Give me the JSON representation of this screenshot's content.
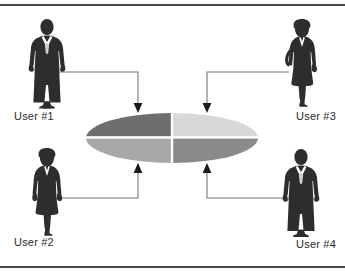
{
  "diagram": {
    "type": "node-hub-diagram",
    "frame": {
      "rule_color": "#4a4a4a",
      "background": "#ffffff"
    },
    "nodes": [
      {
        "id": "user-1",
        "label": "User #1",
        "icon": "businessman-silhouette",
        "position": "top-left",
        "silhouette_color": "#2d2d2d",
        "connects_to_quadrant": "top-left"
      },
      {
        "id": "user-2",
        "label": "User #2",
        "icon": "businesswoman-silhouette",
        "position": "bottom-left",
        "silhouette_color": "#2d2d2d",
        "connects_to_quadrant": "bottom-left"
      },
      {
        "id": "user-3",
        "label": "User #3",
        "icon": "businesswoman-silhouette",
        "position": "top-right",
        "silhouette_color": "#2d2d2d",
        "connects_to_quadrant": "top-right"
      },
      {
        "id": "user-4",
        "label": "User #4",
        "icon": "businessman-silhouette",
        "position": "bottom-right",
        "silhouette_color": "#2d2d2d",
        "connects_to_quadrant": "bottom-right"
      }
    ],
    "central_object": {
      "shape": "ellipse",
      "divisions": 4,
      "quadrants": [
        {
          "name": "top-left",
          "color": "#6e6e6e"
        },
        {
          "name": "top-right",
          "color": "#d8d8d8"
        },
        {
          "name": "bottom-left",
          "color": "#a8a8a8"
        },
        {
          "name": "bottom-right",
          "color": "#8a8a8a"
        }
      ],
      "divider_color": "#ffffff"
    },
    "connectors": {
      "line_color": "#777777",
      "arrow_color": "#1a1a1a",
      "style": "orthogonal-elbow-with-arrowhead",
      "count": 4
    }
  }
}
